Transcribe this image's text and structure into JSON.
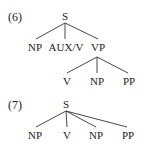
{
  "examples": [
    {
      "number": "(6)",
      "root": "S",
      "children": [
        "NP",
        "AUX/V",
        "VP"
      ],
      "vp_children": [
        "V",
        "NP",
        "PP"
      ]
    },
    {
      "number": "(7)",
      "root": "S",
      "children": [
        "NP",
        "V",
        "NP",
        "PP"
      ]
    }
  ]
}
